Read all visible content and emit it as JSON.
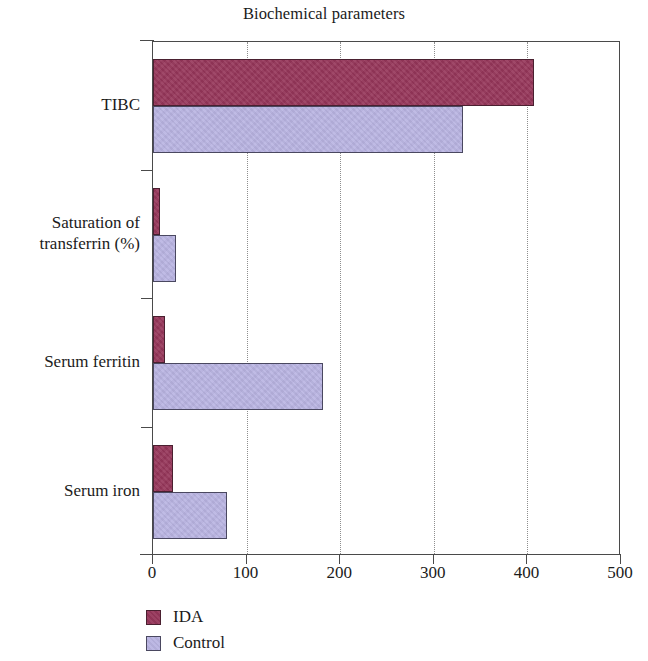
{
  "chart_data": {
    "type": "bar",
    "orientation": "horizontal",
    "title": "Biochemical parameters",
    "xlabel": "",
    "ylabel": "",
    "xlim": [
      0,
      500
    ],
    "xticks": [
      0,
      100,
      200,
      300,
      400,
      500
    ],
    "xtick_labels": [
      "0",
      "100",
      "200",
      "300",
      "400",
      "500"
    ],
    "grid": "vertical-dotted",
    "legend_position": "bottom-left",
    "categories": [
      "TIBC",
      "Saturation of\ntransferrin (%)",
      "Serum ferritin",
      "Serum iron"
    ],
    "category_labels": [
      {
        "line1": "TIBC",
        "line2": ""
      },
      {
        "line1": "Saturation of",
        "line2": "transferrin (%)"
      },
      {
        "line1": "Serum ferritin",
        "line2": ""
      },
      {
        "line1": "Serum iron",
        "line2": ""
      }
    ],
    "series": [
      {
        "name": "IDA",
        "color": "#96365a",
        "values": [
          407,
          7,
          13,
          21
        ]
      },
      {
        "name": "Control",
        "color": "#b9b4e2",
        "values": [
          331,
          25,
          182,
          79
        ]
      }
    ]
  },
  "legend": {
    "items": [
      {
        "label": "IDA",
        "color": "#96365a"
      },
      {
        "label": "Control",
        "color": "#b9b4e2"
      }
    ]
  }
}
